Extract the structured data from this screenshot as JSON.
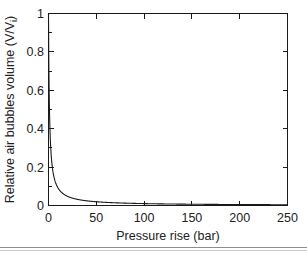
{
  "figure": {
    "background_color": "#ffffff",
    "axis_color": "#1a1a1a",
    "curve_color": "#1a1a1a",
    "rule_color": "#8d8d8d"
  },
  "axis_titles": {
    "x": "Pressure rise (bar)",
    "y_main": "Relative air bubbles volume (V/V",
    "y_sub": "i",
    "y_close": ")"
  },
  "ticks": {
    "x": [
      "0",
      "50",
      "100",
      "150",
      "200",
      "250"
    ],
    "y": [
      "0",
      "0.2",
      "0.4",
      "0.6",
      "0.8",
      "1"
    ]
  },
  "chart_data": {
    "type": "line",
    "title": "",
    "xlabel": "Pressure rise (bar)",
    "ylabel": "Relative air bubbles volume (V/Vi)",
    "xlim": [
      0,
      250
    ],
    "ylim": [
      0,
      1
    ],
    "xticks": [
      0,
      50,
      100,
      150,
      200,
      250
    ],
    "yticks": [
      0,
      0.2,
      0.4,
      0.6,
      0.8,
      1
    ],
    "grid": false,
    "legend": null,
    "legend_position": "none",
    "annotations": [],
    "series": [
      {
        "name": "Relative air bubbles volume",
        "relation": "V/Vi = 1 / (1 + P)",
        "x": [
          0,
          0.25,
          0.5,
          0.75,
          1,
          1.5,
          2,
          2.5,
          3,
          4,
          5,
          6,
          7,
          8,
          9,
          10,
          12,
          14,
          16,
          18,
          20,
          25,
          30,
          35,
          40,
          45,
          50,
          60,
          70,
          80,
          90,
          100,
          110,
          120,
          130,
          140,
          150,
          160,
          170,
          180,
          190,
          200,
          210,
          220,
          230,
          240,
          250
        ],
        "y": [
          1,
          0.8,
          0.667,
          0.571,
          0.5,
          0.4,
          0.333,
          0.286,
          0.25,
          0.2,
          0.167,
          0.143,
          0.125,
          0.111,
          0.1,
          0.0909,
          0.0769,
          0.0667,
          0.0588,
          0.0526,
          0.0476,
          0.0385,
          0.0323,
          0.0278,
          0.0244,
          0.0217,
          0.0196,
          0.0164,
          0.0141,
          0.0123,
          0.011,
          0.0099,
          0.009,
          0.0083,
          0.0076,
          0.0071,
          0.0066,
          0.0062,
          0.0058,
          0.0055,
          0.0052,
          0.005,
          0.0047,
          0.0045,
          0.0043,
          0.0041,
          0.004
        ]
      }
    ]
  }
}
